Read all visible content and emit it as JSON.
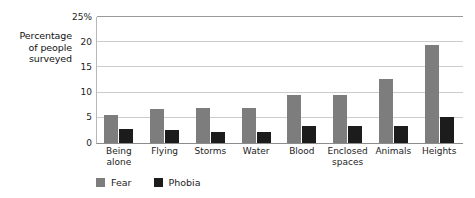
{
  "chart_data": {
    "type": "bar",
    "title": "",
    "subtitle": "",
    "xlabel": "",
    "ylabel": "Percentage of people surveyed",
    "ylabel_lines": [
      "Percentage",
      "of people",
      "surveyed"
    ],
    "ylim": [
      0,
      25
    ],
    "yticks": [
      0,
      5,
      10,
      15,
      20,
      25
    ],
    "ytick_labels": [
      "0",
      "5",
      "10",
      "15",
      "20",
      "25%"
    ],
    "grid": "horizontal",
    "legend_position": "bottom-left",
    "categories": [
      "Being alone",
      "Flying",
      "Storms",
      "Water",
      "Blood",
      "Enclosed spaces",
      "Animals",
      "Heights"
    ],
    "category_lines": [
      [
        "Being",
        "alone"
      ],
      [
        "Flying"
      ],
      [
        "Storms"
      ],
      [
        "Water"
      ],
      [
        "Blood"
      ],
      [
        "Enclosed",
        "spaces"
      ],
      [
        "Animals"
      ],
      [
        "Heights"
      ]
    ],
    "series": [
      {
        "name": "Fear",
        "color": "#7d7d7d",
        "values": [
          5.6,
          6.8,
          7.0,
          7.0,
          9.6,
          9.5,
          12.7,
          19.5
        ]
      },
      {
        "name": "Phobia",
        "color": "#1c1c1c",
        "values": [
          2.8,
          2.5,
          2.2,
          2.2,
          3.3,
          3.3,
          3.4,
          5.2
        ]
      }
    ]
  },
  "legend": {
    "items": [
      {
        "label": "Fear",
        "color": "#7d7d7d"
      },
      {
        "label": "Phobia",
        "color": "#1c1c1c"
      }
    ]
  },
  "colors": {
    "fear": "#7d7d7d",
    "phobia": "#1c1c1c",
    "gridline": "#cccccc",
    "axis": "#8c8c8c",
    "text": "#1d1d1d",
    "background": "#ffffff"
  }
}
